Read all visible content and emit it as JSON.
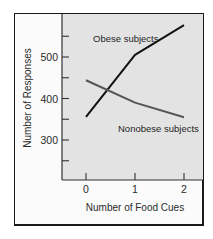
{
  "chart_data": {
    "type": "line",
    "title": "",
    "xlabel": "Number of Food Cues",
    "ylabel": "Number of Responses",
    "x": [
      0,
      1,
      2
    ],
    "xticks": [
      "0",
      "1",
      "2"
    ],
    "xlim": [
      -0.6,
      2.4
    ],
    "ylim": [
      210,
      590
    ],
    "yticks": [
      250,
      300,
      350,
      400,
      450,
      500,
      550
    ],
    "ytick_labels": {
      "300": "300",
      "400": "400",
      "500": "500"
    },
    "grid": false,
    "series": [
      {
        "name": "Obese subjects",
        "values": [
          356,
          505,
          577
        ],
        "color": "#111111"
      },
      {
        "name": "Nonobese subjects",
        "values": [
          444,
          390,
          355
        ],
        "color": "#555555"
      }
    ],
    "annotations": [
      {
        "text": "Obese subjects",
        "series": "Obese subjects"
      },
      {
        "text": "Nonobese subjects",
        "series": "Nonobese subjects"
      }
    ],
    "plot_background": "#e3e3e3"
  }
}
